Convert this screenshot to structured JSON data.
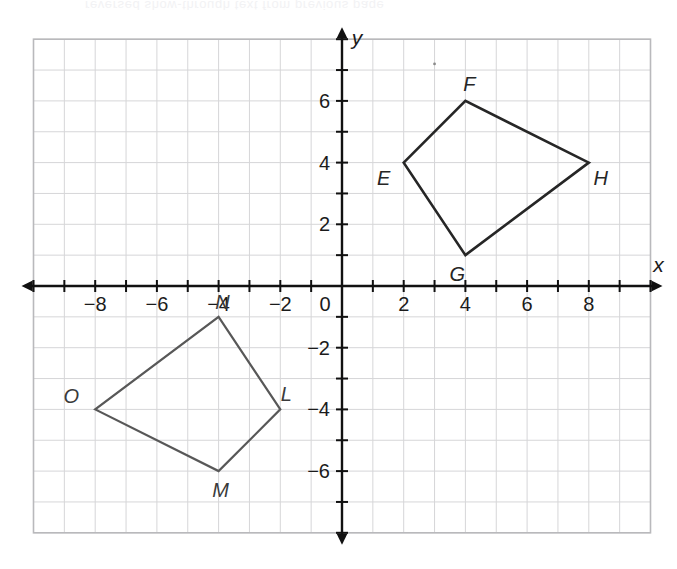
{
  "figure": {
    "axis_labels": {
      "x": "x",
      "y": "y"
    },
    "origin_label": "0",
    "grid": {
      "x_min": -10,
      "x_max": 10,
      "y_min": -8,
      "y_max": 8,
      "grid_on": true,
      "grid_color": "#d6d6d8",
      "border_color": "#b9b9bc",
      "axis_color": "#111111"
    },
    "x_tick_labels": [
      "-8",
      "-6",
      "-4",
      "-2",
      "0",
      "2",
      "4",
      "6",
      "8"
    ],
    "y_tick_labels": [
      "6",
      "4",
      "2",
      "-2",
      "-4",
      "-6"
    ]
  },
  "chart_data": {
    "type": "scatter",
    "xlabel": "x",
    "ylabel": "y",
    "xlim": [
      -10,
      10
    ],
    "ylim": [
      -8,
      8
    ],
    "xticks": [
      -8,
      -6,
      -4,
      -2,
      0,
      2,
      4,
      6,
      8
    ],
    "yticks": [
      6,
      4,
      2,
      -2,
      -4,
      -6
    ],
    "grid": true,
    "legend": "none",
    "series": [
      {
        "name": "EFGH",
        "type": "polygon",
        "color": "#262626",
        "stroke_width": 2.6,
        "closed": true,
        "points": [
          {
            "label": "E",
            "x": 2,
            "y": 4,
            "label_dx": -20,
            "label_dy": 22
          },
          {
            "label": "F",
            "x": 4,
            "y": 6,
            "label_dx": 4,
            "label_dy": -10
          },
          {
            "label": "H",
            "x": 8,
            "y": 4,
            "label_dx": 12,
            "label_dy": 22
          },
          {
            "label": "G",
            "x": 4,
            "y": 1,
            "label_dx": -8,
            "label_dy": 26
          }
        ],
        "edges": [
          "E-F",
          "F-H",
          "H-G",
          "G-E"
        ]
      },
      {
        "name": "LMNO",
        "type": "polygon",
        "color": "#585858",
        "stroke_width": 2.2,
        "closed": true,
        "points": [
          {
            "label": "N",
            "x": -4,
            "y": -1,
            "label_dx": 4,
            "label_dy": -8
          },
          {
            "label": "L",
            "x": -2,
            "y": -4,
            "label_dx": 6,
            "label_dy": -8
          },
          {
            "label": "M",
            "x": -4,
            "y": -6,
            "label_dx": 2,
            "label_dy": 26
          },
          {
            "label": "O",
            "x": -8,
            "y": -4,
            "label_dx": -24,
            "label_dy": -6
          }
        ],
        "edges": [
          "N-L",
          "L-M",
          "M-O",
          "O-N"
        ]
      }
    ],
    "annotations": [
      {
        "text": "stray ink dot",
        "x": 3.0,
        "y": 7.2,
        "kind": "speck"
      }
    ]
  },
  "scan_artifacts": {
    "bleed_through_line": "reversed show-through text from previous page"
  }
}
